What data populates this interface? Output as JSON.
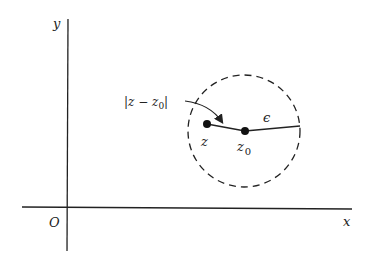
{
  "figure": {
    "axes": {
      "x_label": "x",
      "y_label": "y",
      "origin_label": "O"
    },
    "points": {
      "z_label": "z",
      "z0_label": "z",
      "z0_subscript": "0"
    },
    "annotations": {
      "distance_label_prefix": "|z − z",
      "distance_label_subscript": "0",
      "distance_label_suffix": "|",
      "radius_label": "ϵ"
    },
    "colors": {
      "ink": "#222222",
      "background": "#ffffff"
    }
  }
}
